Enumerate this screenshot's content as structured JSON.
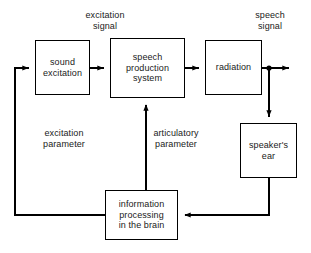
{
  "diagram": {
    "type": "block-diagram",
    "stroke_color": "#000000",
    "text_color": "#1a1a1a",
    "background_color": "#ffffff",
    "nodes": [
      {
        "id": "sound-excitation",
        "label": "sound\nexcitation",
        "x": 35,
        "y": 40,
        "width": 55,
        "height": 55
      },
      {
        "id": "speech-production-system",
        "label": "speech\nproduction\nsystem",
        "x": 110,
        "y": 38,
        "width": 75,
        "height": 60
      },
      {
        "id": "radiation",
        "label": "radiation",
        "x": 205,
        "y": 40,
        "width": 57,
        "height": 55
      },
      {
        "id": "speakers-ear",
        "label": "speaker's\near",
        "x": 240,
        "y": 123,
        "width": 57,
        "height": 55
      },
      {
        "id": "information-processing-in-the-brain",
        "label": "information\nprocessing\nin the brain",
        "x": 105,
        "y": 190,
        "width": 73,
        "height": 50
      }
    ],
    "labels": [
      {
        "id": "excitation-signal",
        "text": "excitation\nsignal",
        "x": 62,
        "y": 10,
        "width": 86
      },
      {
        "id": "speech-signal",
        "text": "speech\nsignal",
        "x": 234,
        "y": 10,
        "width": 72
      },
      {
        "id": "excitation-parameter",
        "text": "excitation\nparameter",
        "x": 21,
        "y": 128,
        "width": 86
      },
      {
        "id": "articulatory-parameter",
        "text": "articulatory\nparameter",
        "x": 133,
        "y": 128,
        "width": 86
      }
    ],
    "connections": [
      {
        "id": "sound-excitation-to-speech-production",
        "from": "sound-excitation",
        "to": "speech-production-system"
      },
      {
        "id": "speech-production-to-radiation",
        "from": "speech-production-system",
        "to": "radiation"
      },
      {
        "id": "radiation-to-speech-signal-output",
        "from": "radiation",
        "to": "speech-signal"
      },
      {
        "id": "radiation-to-speakers-ear",
        "from": "radiation",
        "to": "speakers-ear"
      },
      {
        "id": "speakers-ear-to-information-processing",
        "from": "speakers-ear",
        "to": "information-processing-in-the-brain"
      },
      {
        "id": "information-processing-to-sound-excitation",
        "from": "information-processing-in-the-brain",
        "to": "sound-excitation"
      },
      {
        "id": "information-processing-to-speech-production",
        "from": "information-processing-in-the-brain",
        "to": "speech-production-system"
      }
    ],
    "junctions": [
      {
        "id": "speech-signal-tap",
        "x": 269,
        "y": 68
      }
    ]
  }
}
